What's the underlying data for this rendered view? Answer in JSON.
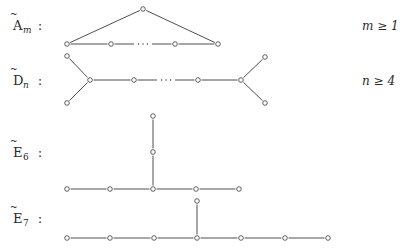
{
  "diagrams": [
    {
      "id": "A",
      "letter": "A",
      "subscript": "m",
      "colon": ":",
      "condition": "m ≥ 1",
      "label_y": 26,
      "nodes": [
        [
          67,
          44
        ],
        [
          111,
          44
        ],
        [
          175,
          44
        ],
        [
          218,
          44
        ],
        [
          143,
          9
        ]
      ],
      "edges": [
        [
          0,
          1
        ],
        [
          2,
          3
        ],
        [
          0,
          4
        ],
        [
          4,
          3
        ]
      ],
      "dotted": [
        [
          111,
          44,
          175,
          44
        ]
      ]
    },
    {
      "id": "D",
      "letter": "D",
      "subscript": "n",
      "colon": ":",
      "condition": "n ≥ 4",
      "label_y": 80,
      "nodes": [
        [
          67,
          56
        ],
        [
          67,
          103
        ],
        [
          90,
          80
        ],
        [
          134,
          80
        ],
        [
          198,
          80
        ],
        [
          241,
          80
        ],
        [
          265,
          57
        ],
        [
          265,
          103
        ]
      ],
      "edges": [
        [
          0,
          2
        ],
        [
          1,
          2
        ],
        [
          2,
          3
        ],
        [
          4,
          5
        ],
        [
          5,
          6
        ],
        [
          5,
          7
        ]
      ],
      "dotted": [
        [
          134,
          80,
          198,
          80
        ]
      ]
    },
    {
      "id": "E6",
      "letter": "E",
      "subscript": "6",
      "colon": ":",
      "condition": "",
      "label_y": 152,
      "nodes": [
        [
          67,
          189
        ],
        [
          110,
          189
        ],
        [
          153,
          189
        ],
        [
          196,
          189
        ],
        [
          239,
          189
        ],
        [
          153,
          152
        ],
        [
          153,
          116
        ]
      ],
      "edges": [
        [
          0,
          1
        ],
        [
          1,
          2
        ],
        [
          2,
          3
        ],
        [
          3,
          4
        ],
        [
          2,
          5
        ],
        [
          5,
          6
        ]
      ],
      "dotted": []
    },
    {
      "id": "E7",
      "letter": "E",
      "subscript": "7",
      "colon": ":",
      "condition": "",
      "label_y": 218,
      "nodes": [
        [
          67,
          238
        ],
        [
          110,
          238
        ],
        [
          154,
          238
        ],
        [
          197,
          238
        ],
        [
          241,
          238
        ],
        [
          285,
          238
        ],
        [
          328,
          238
        ],
        [
          197,
          201
        ]
      ],
      "edges": [
        [
          0,
          1
        ],
        [
          1,
          2
        ],
        [
          2,
          3
        ],
        [
          3,
          4
        ],
        [
          4,
          5
        ],
        [
          5,
          6
        ],
        [
          3,
          7
        ]
      ],
      "dotted": []
    }
  ],
  "style": {
    "line_color": "#3a3a3a",
    "text_color": "#2a2a2a",
    "background": "#ffffff"
  }
}
